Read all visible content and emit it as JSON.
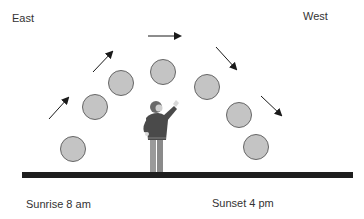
{
  "diagram": {
    "labels": {
      "east": "East",
      "west": "West",
      "sunrise": "Sunrise 8 am",
      "sunset": "Sunset 4 pm"
    },
    "sun_positions_count": 7,
    "arrow_count": 5,
    "arrow_directions": [
      "up-right",
      "up-right",
      "right",
      "down-right",
      "down-right"
    ],
    "figure": "person-pointing-at-sky",
    "colors": {
      "sun_fill": "#c4c4c4",
      "sun_stroke": "#666666",
      "ground": "#1e1e1e",
      "arrow": "#1a1a1a",
      "text": "#333333"
    }
  }
}
